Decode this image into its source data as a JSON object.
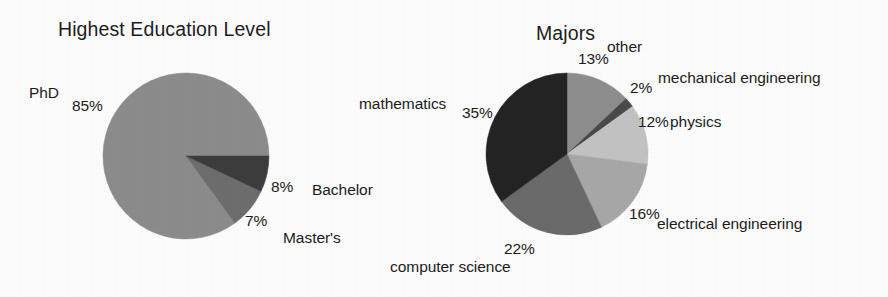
{
  "figure": {
    "width": 888,
    "height": 297,
    "background": "#fdfdfd"
  },
  "charts": [
    {
      "id": "highest-education-level",
      "title": "Highest Education Level",
      "title_pos": {
        "x": 58,
        "y": 18
      },
      "center": {
        "x": 186,
        "y": 156
      },
      "radius": 83,
      "start_angle_deg": 0,
      "direction": "counterclockwise",
      "slices": [
        {
          "label": "PhD",
          "percent": 85,
          "percent_text": "85%",
          "color": "#8c8c8c",
          "label_pos": {
            "x": 29,
            "y": 84
          },
          "pct_pos": {
            "x": 72,
            "y": 97
          }
        },
        {
          "label": "Bachelor",
          "percent": 8,
          "percent_text": "8%",
          "color": "#6e6e6e",
          "label_pos": {
            "x": 312,
            "y": 181
          },
          "pct_pos": {
            "x": 271,
            "y": 178
          }
        },
        {
          "label": "Master's",
          "percent": 7,
          "percent_text": "7%",
          "color": "#3d3d3d",
          "label_pos": {
            "x": 283,
            "y": 229
          },
          "pct_pos": {
            "x": 245,
            "y": 212
          }
        }
      ]
    },
    {
      "id": "majors",
      "title": "Majors",
      "title_pos": {
        "x": 536,
        "y": 22
      },
      "center": {
        "x": 567,
        "y": 154
      },
      "radius": 81,
      "start_angle_deg": 90,
      "direction": "clockwise",
      "slices": [
        {
          "label": "other",
          "percent": 13,
          "percent_text": "13%",
          "color": "#8e8e8e",
          "label_pos": {
            "x": 607,
            "y": 38
          },
          "pct_pos": {
            "x": 578,
            "y": 50
          }
        },
        {
          "label": "mechanical engineering",
          "percent": 2,
          "percent_text": "2%",
          "color": "#4a4a4a",
          "label_pos": {
            "x": 658,
            "y": 69
          },
          "pct_pos": {
            "x": 630,
            "y": 79
          }
        },
        {
          "label": "physics",
          "percent": 12,
          "percent_text": "12%",
          "color": "#c3c3c3",
          "label_pos": {
            "x": 670,
            "y": 113
          },
          "pct_pos": {
            "x": 638,
            "y": 113
          }
        },
        {
          "label": "electrical engineering",
          "percent": 16,
          "percent_text": "16%",
          "color": "#a8a8a8",
          "label_pos": {
            "x": 657,
            "y": 215
          },
          "pct_pos": {
            "x": 629,
            "y": 205
          }
        },
        {
          "label": "computer science",
          "percent": 22,
          "percent_text": "22%",
          "color": "#6b6b6b",
          "label_pos": {
            "x": 390,
            "y": 258
          },
          "pct_pos": {
            "x": 504,
            "y": 240
          }
        },
        {
          "label": "mathematics",
          "percent": 35,
          "percent_text": "35%",
          "color": "#242424",
          "label_pos": {
            "x": 359,
            "y": 95
          },
          "pct_pos": {
            "x": 462,
            "y": 104
          }
        }
      ]
    }
  ]
}
